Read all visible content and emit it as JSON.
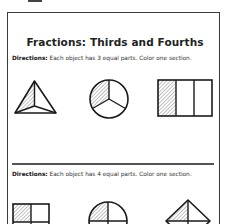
{
  "worksheet": {
    "title": "Fractions: Thirds and Fourths",
    "sections": [
      {
        "directions_label": "Directions:",
        "directions_text": " Each object has 3 equal parts. Color one section.",
        "shapes": [
          {
            "name": "triangle-thirds",
            "parts": 3,
            "shaded": 1
          },
          {
            "name": "circle-thirds",
            "parts": 3,
            "shaded": 1
          },
          {
            "name": "rectangle-thirds",
            "parts": 3,
            "shaded": 1
          }
        ]
      },
      {
        "directions_label": "Directions:",
        "directions_text": " Each object has 4 equal parts. Color one section.",
        "shapes": [
          {
            "name": "square-fourths",
            "parts": 4,
            "shaded": 1
          },
          {
            "name": "circle-fourths",
            "parts": 4,
            "shaded": 1
          },
          {
            "name": "diamond-fourths",
            "parts": 4,
            "shaded": 1
          }
        ]
      }
    ]
  },
  "colors": {
    "stroke": "#1a1a1a",
    "hatch": "#777777",
    "frame": "#3a3a3a"
  }
}
